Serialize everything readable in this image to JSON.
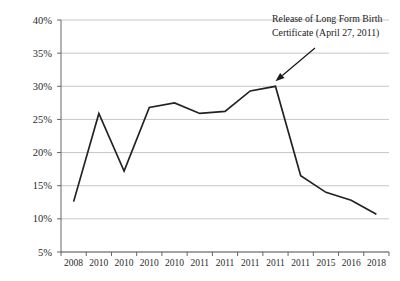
{
  "chart_data": {
    "type": "line",
    "title": "",
    "xlabel": "",
    "ylabel": "",
    "grid": true,
    "legend": "none",
    "ylim": [
      5,
      40
    ],
    "ytick_labels": [
      "40%",
      "35%",
      "30%",
      "25%",
      "20%",
      "15%",
      "10%",
      "5%"
    ],
    "ytick_values": [
      40,
      35,
      30,
      25,
      20,
      15,
      10,
      5
    ],
    "categories": [
      "2008",
      "2010",
      "2010",
      "2010",
      "2010",
      "2011",
      "2011",
      "2011",
      "2011",
      "2011",
      "2015",
      "2016",
      "2018"
    ],
    "values": [
      12.6,
      25.9,
      17.2,
      26.8,
      27.5,
      25.9,
      26.2,
      29.3,
      30.0,
      16.5,
      14.0,
      12.8,
      10.7
    ],
    "series": [
      {
        "name": "",
        "values": [
          12.6,
          25.9,
          17.2,
          26.8,
          27.5,
          25.9,
          26.2,
          29.3,
          30.0,
          16.5,
          14.0,
          12.8,
          10.7
        ]
      }
    ],
    "annotations": [
      {
        "text_line_1": "Release of Long Form Birth",
        "text_line_2": "Certificate (April 27, 2011)",
        "points_to_index": 8,
        "points_to_value": 30.0
      }
    ],
    "colors": {
      "line": "#222222",
      "gridline": "#b9b9b9",
      "axis": "#555555",
      "text": "#1a1a1a",
      "background": "#ffffff"
    }
  }
}
